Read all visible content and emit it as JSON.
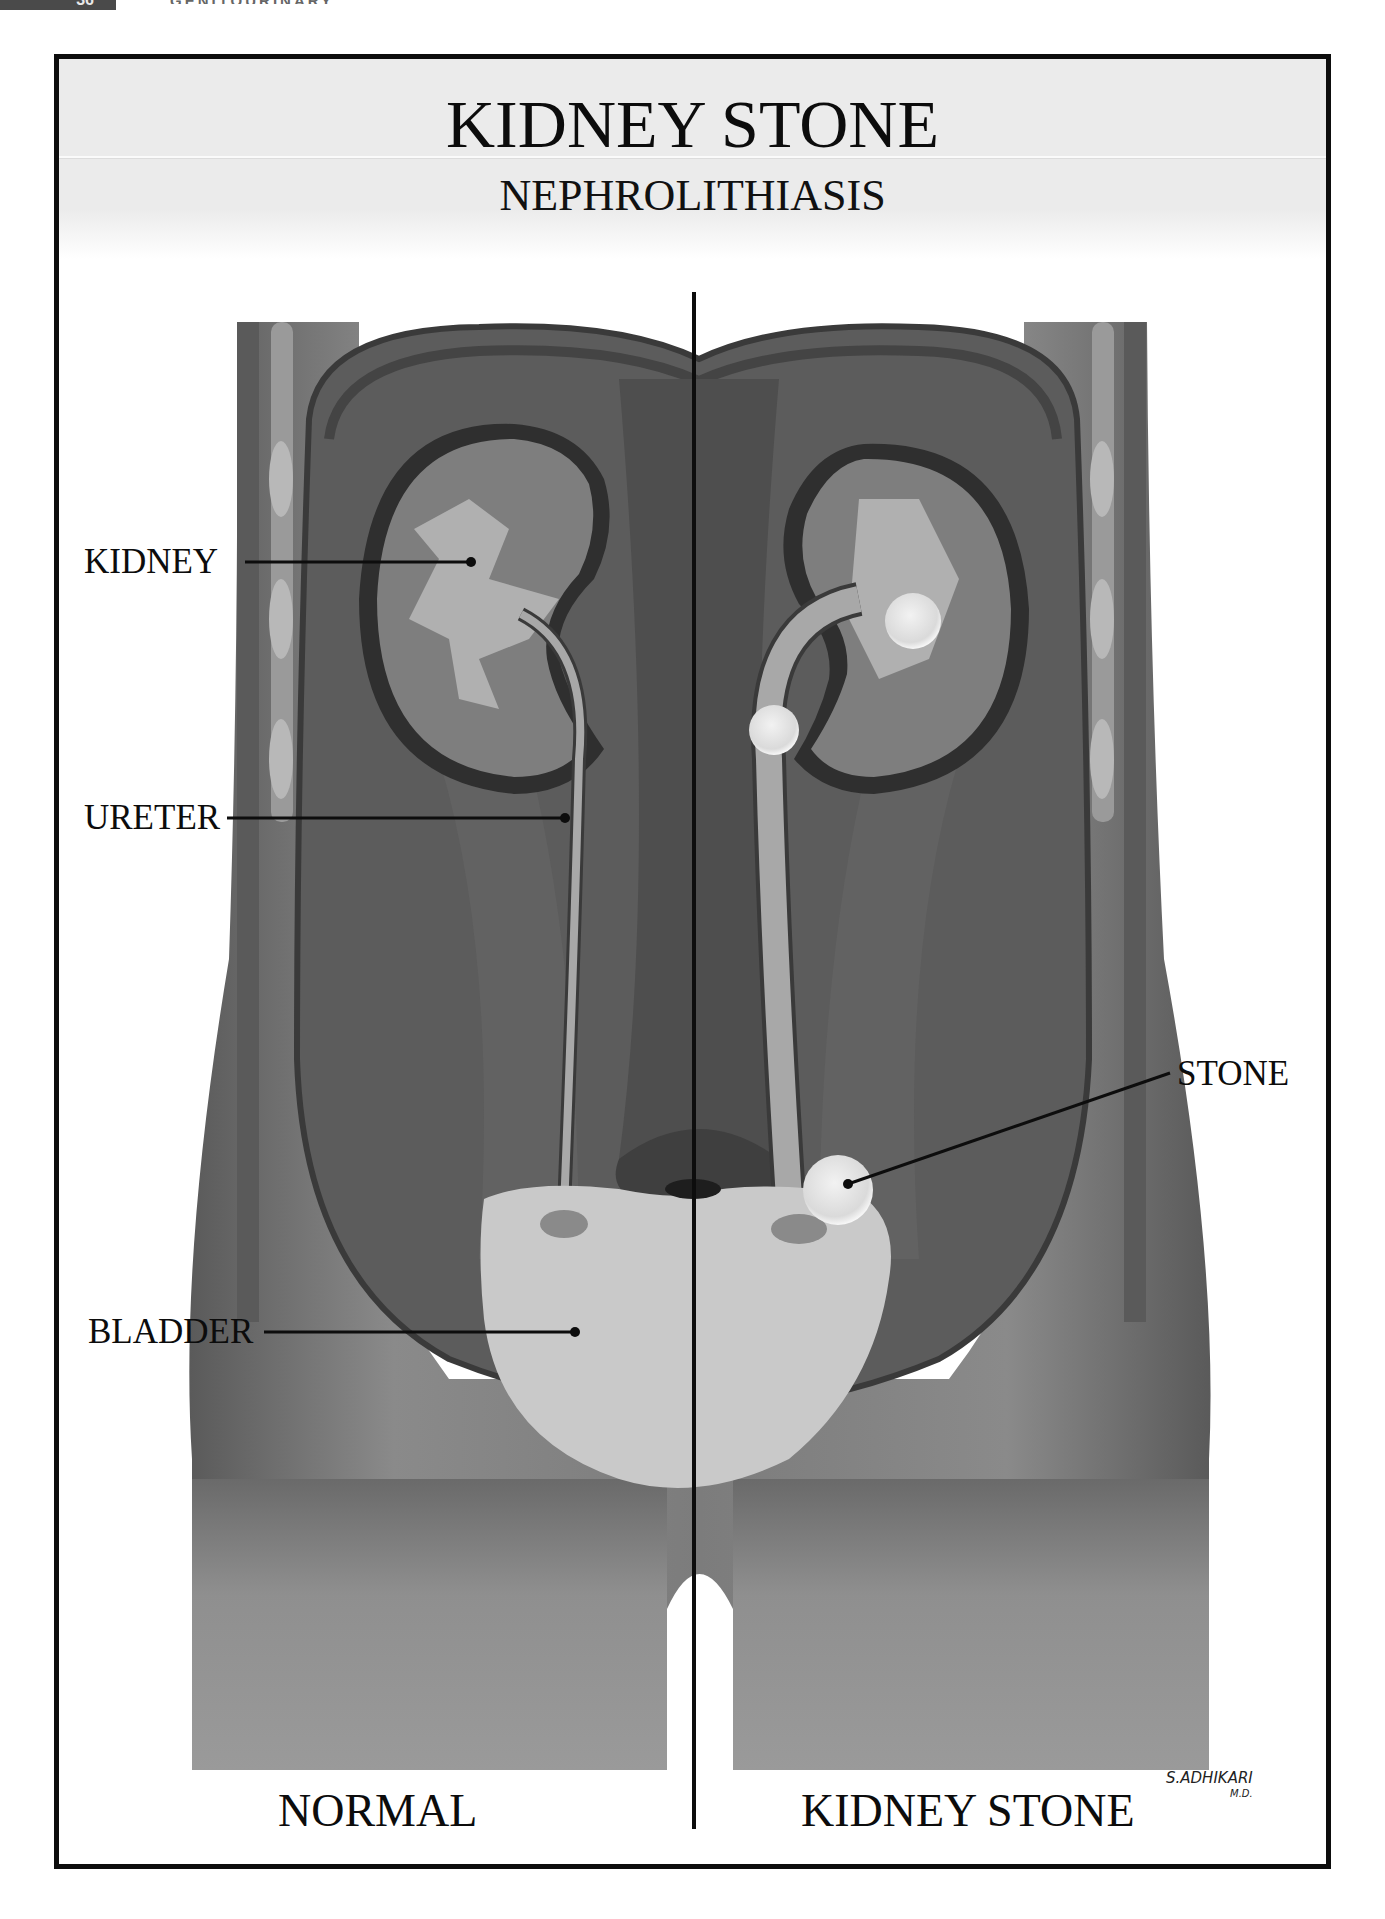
{
  "page": {
    "page_number": "36",
    "running_head": "GENITOURINARY"
  },
  "header": {
    "title": "KIDNEY STONE",
    "subtitle": "NEPHROLITHIASIS"
  },
  "labels": {
    "kidney": "KIDNEY",
    "ureter": "URETER",
    "bladder": "BLADDER",
    "stone": "STONE"
  },
  "panels": {
    "left": "NORMAL",
    "right": "KIDNEY STONE"
  },
  "signature": {
    "name": "S.ADHIKARI",
    "credential": "M.D."
  },
  "colors": {
    "frame": "#0d0d0d",
    "header_bg": "#ebebeb",
    "skin": "#7a7a7a",
    "muscle": "#5f5f5f",
    "kidney": "#8c8c8c",
    "urine": "#b4b4b4",
    "bladder": "#c9c9c9",
    "stone": "#e6e6e6"
  }
}
